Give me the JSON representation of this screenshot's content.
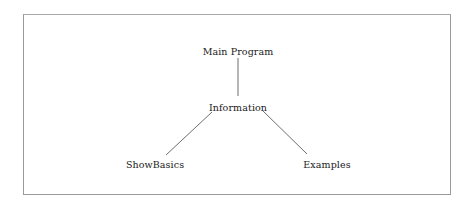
{
  "diagram": {
    "type": "tree",
    "nodes": [
      {
        "id": "main",
        "label": "Main Program",
        "x": 238,
        "y": 51
      },
      {
        "id": "info",
        "label": "Information",
        "x": 238,
        "y": 107
      },
      {
        "id": "basics",
        "label": "ShowBasics",
        "x": 155,
        "y": 164
      },
      {
        "id": "examples",
        "label": "Examples",
        "x": 327,
        "y": 164
      }
    ],
    "edges": [
      {
        "from": "main",
        "to": "info"
      },
      {
        "from": "info",
        "to": "basics"
      },
      {
        "from": "info",
        "to": "examples"
      }
    ]
  }
}
